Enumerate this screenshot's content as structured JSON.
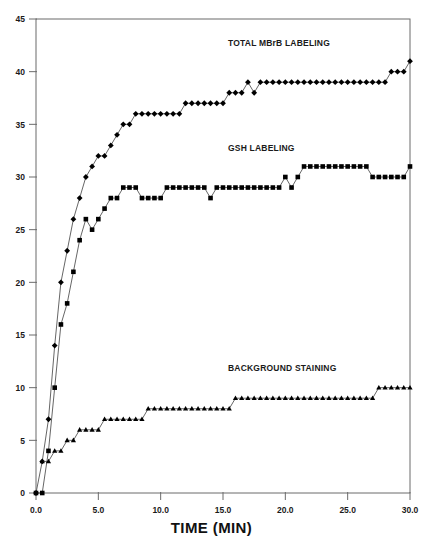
{
  "chart_data": {
    "type": "line",
    "title": "",
    "subtitle": "",
    "xlabel": "TIME (MIN)",
    "ylabel": "",
    "xlim": [
      0,
      30
    ],
    "ylim": [
      0,
      45
    ],
    "xticks": [
      0,
      5,
      10,
      15,
      20,
      25,
      30
    ],
    "xticklabels": [
      "0.0",
      "5.0",
      "10.0",
      "15.0",
      "20.0",
      "25.0",
      "30.0"
    ],
    "yticks": [
      0,
      5,
      10,
      15,
      20,
      25,
      30,
      35,
      40,
      45
    ],
    "yticklabels": [
      "0",
      "5",
      "10",
      "15",
      "20",
      "25",
      "30",
      "35",
      "40",
      "45"
    ],
    "grid": false,
    "legend_position": "inline-annotations",
    "frame": "full-box",
    "line_color": "#555555",
    "marker_color": "#000000",
    "x": [
      0.0,
      0.5,
      1.0,
      1.5,
      2.0,
      2.5,
      3.0,
      3.5,
      4.0,
      4.5,
      5.0,
      5.5,
      6.0,
      6.5,
      7.0,
      7.5,
      8.0,
      8.5,
      9.0,
      9.5,
      10.0,
      10.5,
      11.0,
      11.5,
      12.0,
      12.5,
      13.0,
      13.5,
      14.0,
      14.5,
      15.0,
      15.5,
      16.0,
      16.5,
      17.0,
      17.5,
      18.0,
      18.5,
      19.0,
      19.5,
      20.0,
      20.5,
      21.0,
      21.5,
      22.0,
      22.5,
      23.0,
      23.5,
      24.0,
      24.5,
      25.0,
      25.5,
      26.0,
      26.5,
      27.0,
      27.5,
      28.0,
      28.5,
      29.0,
      29.5,
      30.0
    ],
    "series": [
      {
        "name": "TOTAL MBrB LABELING",
        "marker": "diamond",
        "values": [
          0,
          3,
          7,
          14,
          20,
          23,
          26,
          28,
          30,
          31,
          32,
          32,
          33,
          34,
          35,
          35,
          36,
          36,
          36,
          36,
          36,
          36,
          36,
          36,
          37,
          37,
          37,
          37,
          37,
          37,
          37,
          38,
          38,
          38,
          39,
          38,
          39,
          39,
          39,
          39,
          39,
          39,
          39,
          39,
          39,
          39,
          39,
          39,
          39,
          39,
          39,
          39,
          39,
          39,
          39,
          39,
          39,
          40,
          40,
          40,
          41
        ]
      },
      {
        "name": "GSH LABELING",
        "marker": "square",
        "values": [
          0,
          0,
          4,
          10,
          16,
          18,
          21,
          24,
          26,
          25,
          26,
          27,
          28,
          28,
          29,
          29,
          29,
          28,
          28,
          28,
          28,
          29,
          29,
          29,
          29,
          29,
          29,
          29,
          28,
          29,
          29,
          29,
          29,
          29,
          29,
          29,
          29,
          29,
          29,
          29,
          30,
          29,
          30,
          31,
          31,
          31,
          31,
          31,
          31,
          31,
          31,
          31,
          31,
          31,
          30,
          30,
          30,
          30,
          30,
          30,
          31
        ]
      },
      {
        "name": "BACKGROUND STAINING",
        "marker": "triangle",
        "values": [
          null,
          3,
          3,
          4,
          4,
          5,
          5,
          6,
          6,
          6,
          6,
          7,
          7,
          7,
          7,
          7,
          7,
          7,
          8,
          8,
          8,
          8,
          8,
          8,
          8,
          8,
          8,
          8,
          8,
          8,
          8,
          8,
          9,
          9,
          9,
          9,
          9,
          9,
          9,
          9,
          9,
          9,
          9,
          9,
          9,
          9,
          9,
          9,
          9,
          9,
          9,
          9,
          9,
          9,
          9,
          10,
          10,
          10,
          10,
          10,
          10
        ]
      }
    ],
    "annotations": [
      {
        "text": "TOTAL MBrB LABELING",
        "x": 22.0,
        "y": 42.5
      },
      {
        "text": "GSH LABELING",
        "x": 22.0,
        "y": 32.5
      },
      {
        "text": "BACKGROUND STAINING",
        "x": 22.0,
        "y": 11.8
      }
    ]
  }
}
